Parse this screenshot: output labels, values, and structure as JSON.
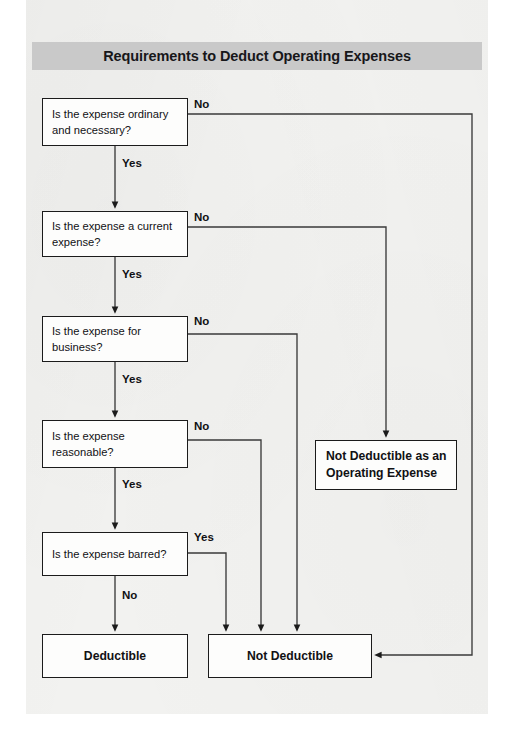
{
  "header": {
    "title": "Requirements to Deduct Operating Expenses",
    "bar_color": "#c9c9c9"
  },
  "page": {
    "background_color": "#f2f2f0",
    "ink_color": "#1b1b1b"
  },
  "flowchart": {
    "type": "decision-flowchart",
    "decisions": [
      {
        "id": "ordinary",
        "lines": [
          "Is the expense ordinary",
          "and necessary?"
        ],
        "yes_label": "Yes",
        "no_label": "No",
        "yes_target": "current",
        "no_target": "not-deductible"
      },
      {
        "id": "current",
        "lines": [
          "Is the expense a current",
          "expense?"
        ],
        "yes_label": "Yes",
        "no_label": "No",
        "yes_target": "business",
        "no_target": "not-deductible-operating-expense"
      },
      {
        "id": "business",
        "lines": [
          "Is the expense for",
          "business?"
        ],
        "yes_label": "Yes",
        "no_label": "No",
        "yes_target": "reasonable",
        "no_target": "not-deductible"
      },
      {
        "id": "reasonable",
        "lines": [
          "Is the expense",
          "reasonable?"
        ],
        "yes_label": "Yes",
        "no_label": "No",
        "yes_target": "barred",
        "no_target": "not-deductible"
      },
      {
        "id": "barred",
        "lines": [
          "Is the expense barred?"
        ],
        "yes_label": "Yes",
        "no_label": "No",
        "yes_target": "not-deductible",
        "no_target": "deductible"
      }
    ],
    "terminals": [
      {
        "id": "deductible",
        "lines": [
          "Deductible"
        ]
      },
      {
        "id": "not-deductible",
        "lines": [
          "Not Deductible"
        ]
      },
      {
        "id": "not-deductible-operating-expense",
        "lines": [
          "Not Deductible as an",
          "Operating Expense"
        ]
      }
    ]
  }
}
